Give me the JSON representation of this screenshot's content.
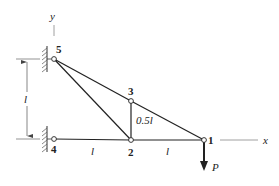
{
  "diagram": {
    "type": "truss",
    "nodes": [
      {
        "id": "1",
        "label": "1",
        "x": 204,
        "y": 140
      },
      {
        "id": "2",
        "label": "2",
        "x": 131,
        "y": 140
      },
      {
        "id": "3",
        "label": "3",
        "x": 131,
        "y": 101
      },
      {
        "id": "4",
        "label": "4",
        "x": 54,
        "y": 139
      },
      {
        "id": "5",
        "label": "5",
        "x": 54,
        "y": 59
      }
    ],
    "members": [
      [
        "4",
        "2"
      ],
      [
        "2",
        "1"
      ],
      [
        "5",
        "3"
      ],
      [
        "3",
        "1"
      ],
      [
        "5",
        "2"
      ],
      [
        "3",
        "2"
      ]
    ],
    "supports": [
      {
        "node": "5",
        "type": "pinned-wall"
      },
      {
        "node": "4",
        "type": "pinned-wall"
      }
    ],
    "axes": {
      "x_label": "x",
      "y_label": "y"
    },
    "dimensions": {
      "vertical_span": "l",
      "segment_4_2": "l",
      "segment_2_1": "l",
      "height_2_3": "0.5l"
    },
    "load": {
      "node": "1",
      "label": "P",
      "direction": "down"
    },
    "colors": {
      "line": "#222222",
      "hatch": "#555555",
      "node_fill": "#ffffff"
    }
  }
}
